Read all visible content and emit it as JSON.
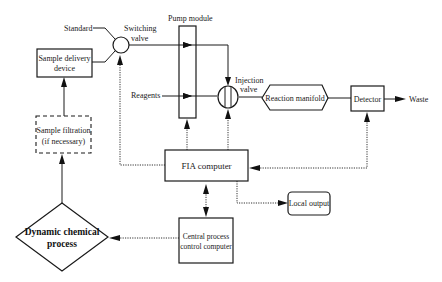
{
  "diagram": {
    "nodes": {
      "standard": {
        "label": "Standard"
      },
      "switching_valve": {
        "label_line1": "Switching",
        "label_line2": "valve"
      },
      "pump_module": {
        "label": "Pump module"
      },
      "sample_delivery": {
        "label_line1": "Sample delivery",
        "label_line2": "device"
      },
      "sample_filtration": {
        "label_line1": "Sample filtration",
        "label_line2": "(if necessary)"
      },
      "reagents": {
        "label": "Reagents"
      },
      "injection_valve": {
        "label_line1": "Injection",
        "label_line2": "valve"
      },
      "reaction_manifold": {
        "label": "Reaction manifold"
      },
      "detector": {
        "label": "Detector"
      },
      "waste": {
        "label": "Waste"
      },
      "fia_computer": {
        "label": "FIA  computer"
      },
      "local_output": {
        "label": "Local output"
      },
      "dynamic_process": {
        "label_line1": "Dynamic chemical",
        "label_line2": "process"
      },
      "central_computer": {
        "label_line1": "Central process",
        "label_line2": "control computer"
      }
    },
    "edges": [
      {
        "from": "Dynamic chemical process",
        "to": "Sample filtration",
        "style": "solid"
      },
      {
        "from": "Sample filtration",
        "to": "Sample delivery device",
        "style": "solid"
      },
      {
        "from": "Sample delivery device",
        "to": "Switching valve",
        "style": "solid"
      },
      {
        "from": "Standard",
        "to": "Switching valve",
        "style": "solid"
      },
      {
        "from": "Switching valve",
        "to": "Pump module",
        "style": "solid"
      },
      {
        "from": "Pump module",
        "to": "Injection valve",
        "style": "solid"
      },
      {
        "from": "Reagents",
        "to": "Pump module",
        "style": "solid"
      },
      {
        "from": "Pump module",
        "to": "Injection valve",
        "style": "solid"
      },
      {
        "from": "Injection valve",
        "to": "Reaction manifold",
        "style": "solid"
      },
      {
        "from": "Reaction manifold",
        "to": "Detector",
        "style": "solid"
      },
      {
        "from": "Detector",
        "to": "Waste",
        "style": "solid"
      },
      {
        "from": "FIA computer",
        "to": "Switching valve",
        "style": "dotted"
      },
      {
        "from": "FIA computer",
        "to": "Pump module",
        "style": "dotted"
      },
      {
        "from": "FIA computer",
        "to": "Injection valve",
        "style": "dotted"
      },
      {
        "from": "FIA computer",
        "to": "Detector",
        "style": "dotted",
        "bidirectional": true
      },
      {
        "from": "FIA computer",
        "to": "Local output",
        "style": "dotted"
      },
      {
        "from": "FIA computer",
        "to": "Central process control computer",
        "style": "dotted",
        "bidirectional": true
      },
      {
        "from": "Central process control computer",
        "to": "Dynamic chemical process",
        "style": "dotted"
      }
    ]
  }
}
